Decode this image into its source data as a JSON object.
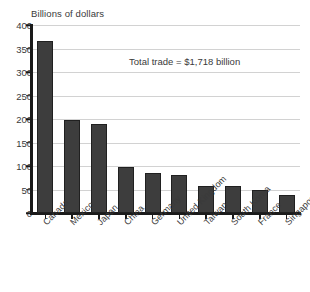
{
  "chart_data": {
    "type": "bar",
    "title": "",
    "ylabel": "Billions of dollars",
    "xlabel": "",
    "ylim": [
      0,
      400
    ],
    "yticks": [
      0,
      50,
      100,
      150,
      200,
      250,
      300,
      350,
      400
    ],
    "grid": true,
    "legend": "none",
    "annotations": [
      {
        "text": "Total trade = $1,718 billion",
        "x": 129,
        "y": 56
      }
    ],
    "categories": [
      "Canada",
      "Mexico",
      "Japan",
      "China",
      "Germany",
      "United Kingdom",
      "Taiwan",
      "South Korea",
      "France",
      "Singapore"
    ],
    "values": [
      365,
      197,
      190,
      97,
      85,
      80,
      57,
      57,
      49,
      39
    ],
    "series": [
      {
        "name": "Trade value",
        "values": [
          365,
          197,
          190,
          97,
          85,
          80,
          57,
          57,
          49,
          39
        ]
      }
    ]
  },
  "style": {
    "bar_color": "#3d3d3d",
    "bar_edge_color": "#202020",
    "grid_color": "#d2d2d2",
    "axis_color": "#1a1a1a",
    "text_color": "#3a3a3a",
    "background": "#ffffff"
  }
}
